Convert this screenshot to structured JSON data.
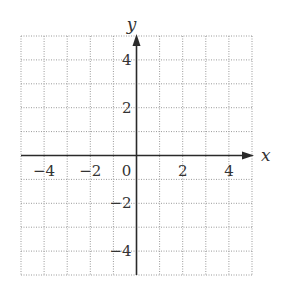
{
  "chart_data": {
    "type": "coordinate-grid",
    "title": "",
    "xlabel": "x",
    "ylabel": "y",
    "xlim": [
      -5,
      5
    ],
    "ylim": [
      -5,
      5
    ],
    "grid": true,
    "grid_style": "dotted",
    "grid_step": 1,
    "x_ticks": [
      {
        "value": -4,
        "label": "−4"
      },
      {
        "value": -2,
        "label": "−2"
      },
      {
        "value": 0,
        "label": "0"
      },
      {
        "value": 2,
        "label": "2"
      },
      {
        "value": 4,
        "label": "4"
      }
    ],
    "y_ticks": [
      {
        "value": 4,
        "label": "4"
      },
      {
        "value": 2,
        "label": "2"
      },
      {
        "value": -2,
        "label": "−2"
      },
      {
        "value": -4,
        "label": "−4"
      }
    ],
    "series": []
  },
  "colors": {
    "grid": "#9a9a9a",
    "axis": "#2a2a2a",
    "text": "#333333",
    "background": "#ffffff"
  }
}
